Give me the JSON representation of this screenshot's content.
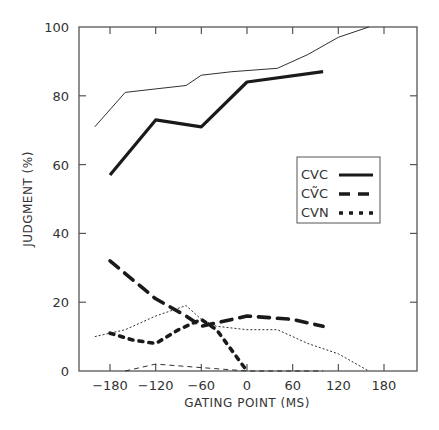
{
  "chart_data": {
    "type": "line",
    "title": "",
    "xlabel": "GATING POINT (MS)",
    "ylabel": "JUDGMENT (%)",
    "xlim": [
      -220,
      220
    ],
    "ylim": [
      0,
      100
    ],
    "x_ticks": [
      -180,
      -120,
      -60,
      0,
      60,
      120,
      180
    ],
    "x_tick_labels": [
      "−180",
      "−120",
      "−60",
      "0",
      "60",
      "120",
      "180"
    ],
    "y_ticks": [
      0,
      20,
      40,
      60,
      80,
      100
    ],
    "y_tick_labels": [
      "0",
      "20",
      "40",
      "60",
      "80",
      "100"
    ],
    "grid": false,
    "legend_position": "right-middle",
    "legend": [
      {
        "label": "CVC",
        "style": "solid-thick"
      },
      {
        "label": "CṼC",
        "style": "long-dash-thick"
      },
      {
        "label": "CVN",
        "style": "short-dash-thick"
      }
    ],
    "series": [
      {
        "name": "CVC",
        "style": "solid-thick",
        "x": [
          -180,
          -120,
          -60,
          0,
          100
        ],
        "y": [
          57,
          73,
          71,
          84,
          87
        ]
      },
      {
        "name": "CṼC",
        "style": "long-dash-thick",
        "x": [
          -180,
          -120,
          -80,
          -60,
          0,
          60,
          100
        ],
        "y": [
          32,
          21,
          16,
          13,
          16,
          15,
          13
        ]
      },
      {
        "name": "CVN",
        "style": "short-dash-thick",
        "x": [
          -180,
          -150,
          -120,
          -90,
          -60,
          -40,
          -20,
          0
        ],
        "y": [
          11,
          9,
          8,
          12,
          15,
          12,
          6,
          0
        ]
      },
      {
        "name": "CVC (comparison)",
        "style": "solid-thin",
        "x": [
          -200,
          -160,
          -120,
          -80,
          -60,
          -20,
          40,
          80,
          120,
          160
        ],
        "y": [
          71,
          81,
          82,
          83,
          86,
          87,
          88,
          92,
          97,
          100
        ]
      },
      {
        "name": "CVN (comparison)",
        "style": "dotted-thin",
        "x": [
          -200,
          -160,
          -120,
          -80,
          -60,
          -40,
          0,
          40,
          80,
          120,
          160
        ],
        "y": [
          10,
          12,
          16,
          19,
          15,
          13,
          12,
          12,
          8,
          5,
          0
        ]
      },
      {
        "name": "CṼC (comparison)",
        "style": "dashed-thin",
        "x": [
          -160,
          -120,
          -60,
          0,
          100
        ],
        "y": [
          0,
          2,
          1,
          0,
          0
        ]
      }
    ]
  }
}
